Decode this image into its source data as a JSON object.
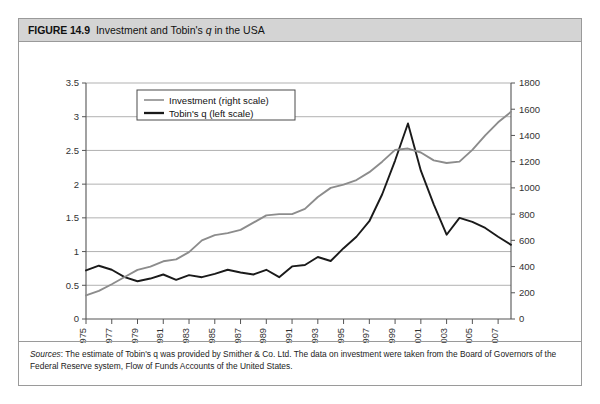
{
  "figure": {
    "number_label": "FIGURE 14.9",
    "title_part1": "Investment and Tobin's ",
    "title_italic": "q",
    "title_part2": " in the USA"
  },
  "sources": {
    "label": "Sources",
    "colon": ":",
    "text": " The estimate of Tobin's q was provided by Smither & Co. Ltd. The data on investment were taken from the Board of Governors of the Federal Reserve system, Flow of Funds Accounts of the United States."
  },
  "colors": {
    "investment_line": "#8c8c8c",
    "tobin_line": "#1a1a1a",
    "grid": "#a8a8a8",
    "axis": "#555555",
    "header_bg": "#d4d4d4",
    "border": "#9a9a9a"
  },
  "chart_data": {
    "type": "line",
    "title": "Investment and Tobin's q in the USA",
    "xlabel": "",
    "ylabel": "",
    "grid": true,
    "legend_position": "top-left-inside",
    "x": [
      1975,
      1976,
      1977,
      1978,
      1979,
      1980,
      1981,
      1982,
      1983,
      1984,
      1985,
      1986,
      1987,
      1988,
      1989,
      1990,
      1991,
      1992,
      1993,
      1994,
      1995,
      1996,
      1997,
      1998,
      1999,
      2000,
      2001,
      2002,
      2003,
      2004,
      2005,
      2006,
      2007,
      2008
    ],
    "year_ticks": [
      1975,
      1977,
      1979,
      1981,
      1983,
      1985,
      1987,
      1989,
      1991,
      1993,
      1995,
      1997,
      1999,
      2001,
      2003,
      2005,
      2007
    ],
    "left_axis": {
      "name": "Tobin's q (left scale)",
      "ticks": [
        0,
        0.5,
        1,
        1.5,
        2,
        2.5,
        3,
        3.5
      ],
      "tick_labels": [
        "0",
        "0.5",
        "1",
        "1.5",
        "2",
        "2.5",
        "3",
        "3.5"
      ],
      "min": 0,
      "max": 3.5
    },
    "right_axis": {
      "name": "Investment (right scale)",
      "ticks": [
        0,
        200,
        400,
        600,
        800,
        1000,
        1200,
        1400,
        1600,
        1800
      ],
      "tick_labels": [
        "0",
        "200",
        "400",
        "600",
        "800",
        "1000",
        "1200",
        "1400",
        "1600",
        "1800"
      ],
      "min": 0,
      "max": 1800
    },
    "series": [
      {
        "name": "Tobin's q (left scale)",
        "axis": "left",
        "color": "#1a1a1a",
        "width": 1.9,
        "values": [
          0.72,
          0.79,
          0.73,
          0.62,
          0.56,
          0.6,
          0.66,
          0.58,
          0.65,
          0.62,
          0.67,
          0.73,
          0.69,
          0.66,
          0.73,
          0.62,
          0.78,
          0.8,
          0.92,
          0.86,
          1.05,
          1.22,
          1.45,
          1.85,
          2.35,
          2.9,
          2.2,
          1.7,
          1.25,
          1.5,
          1.44,
          1.35,
          1.22,
          1.1
        ]
      },
      {
        "name": "Investment (right scale)",
        "axis": "right",
        "color": "#8c8c8c",
        "width": 1.9,
        "values": [
          180,
          215,
          265,
          320,
          375,
          400,
          440,
          455,
          510,
          600,
          640,
          655,
          680,
          735,
          790,
          800,
          800,
          840,
          930,
          1000,
          1025,
          1060,
          1120,
          1200,
          1290,
          1300,
          1270,
          1210,
          1190,
          1200,
          1290,
          1400,
          1500,
          1580
        ]
      }
    ],
    "legend": [
      {
        "label": "Investment (right scale)",
        "color": "#8c8c8c"
      },
      {
        "label": "Tobin's q (left scale)",
        "color": "#1a1a1a"
      }
    ]
  }
}
